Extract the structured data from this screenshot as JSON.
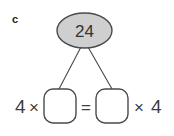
{
  "figure": {
    "part_label": "c",
    "background_color": "#ffffff",
    "stroke_color": "#4a4a4a",
    "text_color": "#3f3f3f"
  },
  "bubble": {
    "value": "24",
    "fill_color": "#cfcfcf",
    "stroke_color": "#4a4a4a",
    "shape": "ellipse"
  },
  "connectors": [
    {
      "name": "left-branch",
      "from": "bubble-bottom",
      "to": "left-answer-box"
    },
    {
      "name": "right-branch",
      "from": "bubble-bottom",
      "to": "right-answer-box"
    }
  ],
  "equation": {
    "left_factor": "4",
    "left_operator": "×",
    "left_box_value": "",
    "equals": "=",
    "right_box_value": "",
    "right_operator": "×",
    "right_factor": "4",
    "box_fill_color": "#ffffff",
    "box_stroke_color": "#4a4a4a"
  }
}
